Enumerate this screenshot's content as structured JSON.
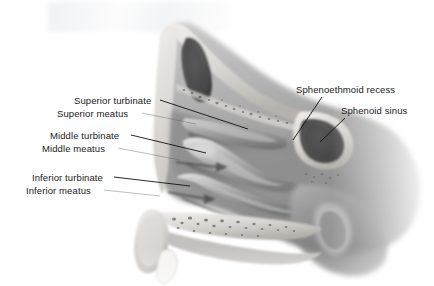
{
  "figure": {
    "width": 434,
    "height": 286,
    "background_color": "#ffffff",
    "line_color": "#111111",
    "text_color": "#1a1a1a",
    "style": "grayscale medical illustration, sagittal section"
  },
  "labels": [
    {
      "id": "superior-turbinate",
      "text": "Superior turbinate",
      "side": "left",
      "text_x": 74,
      "text_y": 95,
      "leader": {
        "x1": 160,
        "y1": 100,
        "x2": 248,
        "y2": 129
      }
    },
    {
      "id": "superior-meatus",
      "text": "Superior meatus",
      "side": "left",
      "text_x": 57,
      "text_y": 108,
      "leader": {
        "x1": 142,
        "y1": 113,
        "x2": 196,
        "y2": 124
      }
    },
    {
      "id": "middle-turbinate",
      "text": "Middle turbinate",
      "side": "left",
      "text_x": 50,
      "text_y": 130,
      "leader": {
        "x1": 131,
        "y1": 135,
        "x2": 206,
        "y2": 153
      }
    },
    {
      "id": "middle-meatus",
      "text": "Middle meatus",
      "side": "left",
      "text_x": 42,
      "text_y": 143,
      "leader": {
        "x1": 118,
        "y1": 148,
        "x2": 180,
        "y2": 160
      }
    },
    {
      "id": "inferior-turbinate",
      "text": "Inferior turbinate",
      "side": "left",
      "text_x": 32,
      "text_y": 172,
      "leader": {
        "x1": 114,
        "y1": 177,
        "x2": 190,
        "y2": 186
      }
    },
    {
      "id": "inferior-meatus",
      "text": "Inferior meatus",
      "side": "left",
      "text_x": 26,
      "text_y": 185,
      "leader": {
        "x1": 104,
        "y1": 190,
        "x2": 160,
        "y2": 196
      }
    },
    {
      "id": "sphenoethmoid-recess",
      "text": "Sphenoethmoid recess",
      "side": "right",
      "text_x": 296,
      "text_y": 84,
      "leader": {
        "x1": 322,
        "y1": 97,
        "x2": 293,
        "y2": 140
      }
    },
    {
      "id": "sphenoid-sinus",
      "text": "Sphenoid sinus",
      "side": "right",
      "text_x": 341,
      "text_y": 105,
      "leader": {
        "x1": 345,
        "y1": 118,
        "x2": 320,
        "y2": 142
      }
    }
  ],
  "structures": [
    {
      "id": "frontal-sinus",
      "name": "frontal sinus cavity",
      "tone": "#5a5a5a"
    },
    {
      "id": "nasal-bridge",
      "name": "nasal bridge bone",
      "tone": "#cfcfcf"
    },
    {
      "id": "superior-turbinate-body",
      "name": "superior turbinate",
      "tone": "#9a9a9a"
    },
    {
      "id": "middle-turbinate-body",
      "name": "middle turbinate",
      "tone": "#b0b0b0"
    },
    {
      "id": "inferior-turbinate-body",
      "name": "inferior turbinate",
      "tone": "#a8a8a8"
    },
    {
      "id": "sphenoid-sinus-cavity",
      "name": "sphenoid sinus cavity",
      "tone": "#555555"
    },
    {
      "id": "hard-palate",
      "name": "hard palate with bone marrow speckle",
      "tone": "#c8c8c8"
    },
    {
      "id": "nose-tip",
      "name": "external nose tip",
      "tone": "#d2d2d2"
    },
    {
      "id": "incisor-tooth",
      "name": "upper incisor tooth",
      "tone": "#f2f2f0"
    },
    {
      "id": "nasopharynx",
      "name": "nasopharynx",
      "tone": "#8e8e8e"
    },
    {
      "id": "airflow-arrow-middle",
      "name": "airflow arrow through middle meatus",
      "tone": "#4a4a4a"
    },
    {
      "id": "airflow-arrow-inferior",
      "name": "airflow arrow through inferior meatus",
      "tone": "#4a4a4a"
    }
  ]
}
